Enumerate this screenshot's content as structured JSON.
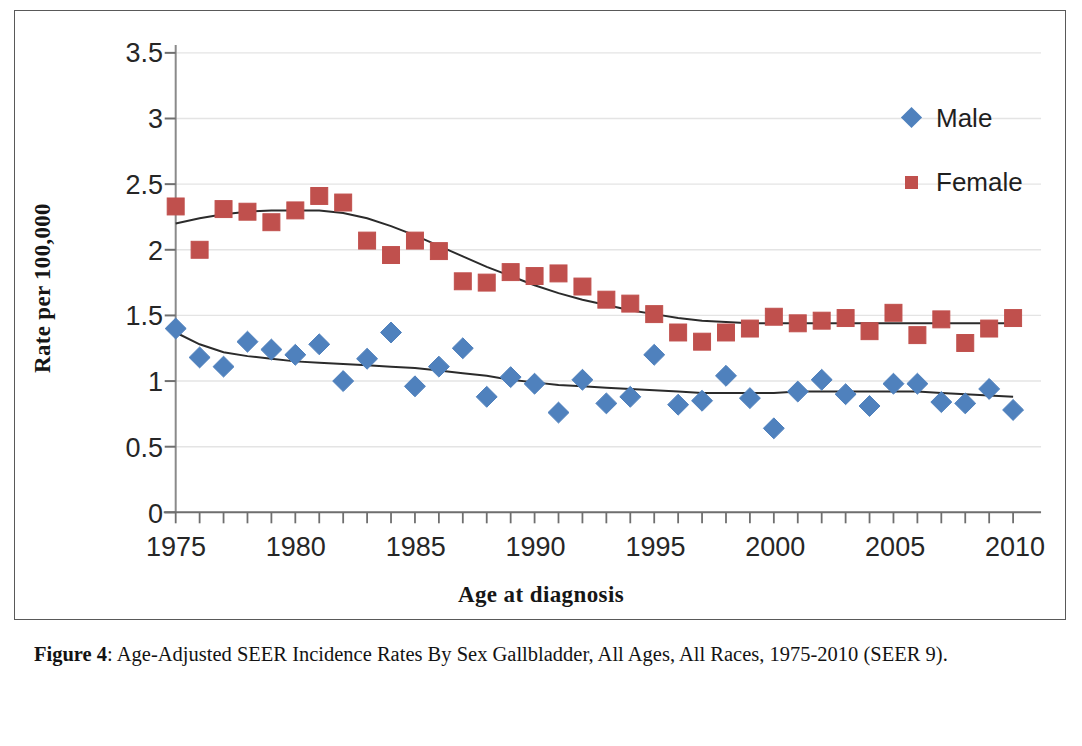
{
  "figure": {
    "caption_label": "Figure 4",
    "caption_text": ": Age-Adjusted SEER Incidence Rates By Sex Gallbladder, All Ages, All Races, 1975-2010 (SEER 9)."
  },
  "legend": {
    "position": "top-right",
    "entries": [
      {
        "label": "Male",
        "marker": "diamond-marker-icon",
        "color": "#4F81BD"
      },
      {
        "label": "Female",
        "marker": "square-marker-icon",
        "color": "#C0504D"
      }
    ]
  },
  "axes": {
    "x_title": "Age at diagnosis",
    "y_title": "Rate per 100,000",
    "x_ticks": [
      "1975",
      "1980",
      "1985",
      "1990",
      "1995",
      "2000",
      "2005",
      "2010"
    ],
    "y_ticks": [
      "0",
      "0.5",
      "1",
      "1.5",
      "2",
      "2.5",
      "3",
      "3.5"
    ]
  },
  "chart_data": {
    "type": "scatter",
    "title": "",
    "subtitle": "",
    "xlabel": "Age at diagnosis",
    "ylabel": "Rate per 100,000",
    "xlim": [
      1975,
      2010
    ],
    "ylim": [
      0,
      3.5
    ],
    "x_tick_step": 5,
    "x_minor_tick_step": 1,
    "y_tick_step": 0.5,
    "grid": "horizontal",
    "legend_position": "top-right",
    "x": [
      1975,
      1976,
      1977,
      1978,
      1979,
      1980,
      1981,
      1982,
      1983,
      1984,
      1985,
      1986,
      1987,
      1988,
      1989,
      1990,
      1991,
      1992,
      1993,
      1994,
      1995,
      1996,
      1997,
      1998,
      1999,
      2000,
      2001,
      2002,
      2003,
      2004,
      2005,
      2006,
      2007,
      2008,
      2009,
      2010
    ],
    "series": [
      {
        "name": "Male",
        "marker": "diamond",
        "color": "#4F81BD",
        "values": [
          1.4,
          1.18,
          1.11,
          1.3,
          1.24,
          1.2,
          1.28,
          1.0,
          1.17,
          1.37,
          0.96,
          1.11,
          1.25,
          0.88,
          1.03,
          0.98,
          0.76,
          1.01,
          0.83,
          0.88,
          1.2,
          0.82,
          0.85,
          1.04,
          0.87,
          0.64,
          0.92,
          1.01,
          0.9,
          0.81,
          0.98,
          0.98,
          0.84,
          0.83,
          0.94,
          0.78
        ],
        "trend": [
          1.37,
          1.28,
          1.22,
          1.19,
          1.17,
          1.15,
          1.14,
          1.13,
          1.12,
          1.11,
          1.1,
          1.08,
          1.06,
          1.04,
          1.01,
          0.99,
          0.97,
          0.96,
          0.95,
          0.94,
          0.93,
          0.92,
          0.91,
          0.91,
          0.91,
          0.91,
          0.92,
          0.92,
          0.92,
          0.92,
          0.92,
          0.92,
          0.91,
          0.9,
          0.89,
          0.88
        ]
      },
      {
        "name": "Female",
        "marker": "square",
        "color": "#C0504D",
        "values": [
          2.33,
          2.0,
          2.31,
          2.29,
          2.21,
          2.3,
          2.41,
          2.36,
          2.07,
          1.96,
          2.07,
          1.99,
          1.76,
          1.75,
          1.83,
          1.8,
          1.82,
          1.72,
          1.62,
          1.59,
          1.51,
          1.37,
          1.3,
          1.37,
          1.4,
          1.49,
          1.44,
          1.46,
          1.48,
          1.38,
          1.52,
          1.35,
          1.47,
          1.29,
          1.4,
          1.48
        ],
        "trend": [
          2.2,
          2.24,
          2.27,
          2.29,
          2.3,
          2.3,
          2.3,
          2.28,
          2.24,
          2.18,
          2.11,
          2.03,
          1.95,
          1.87,
          1.8,
          1.73,
          1.67,
          1.62,
          1.58,
          1.54,
          1.51,
          1.48,
          1.46,
          1.45,
          1.44,
          1.44,
          1.44,
          1.44,
          1.44,
          1.44,
          1.44,
          1.44,
          1.44,
          1.44,
          1.44,
          1.44
        ]
      }
    ]
  },
  "colors": {
    "male": "#4F81BD",
    "female": "#C0504D",
    "trendline": "#2b2b2b",
    "gridline": "#e4e4e4",
    "axis": "#8a8a8a",
    "frame": "#595959"
  }
}
